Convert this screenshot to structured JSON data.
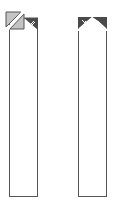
{
  "panels": [
    {
      "id": "left",
      "icon": "fold-split-icon",
      "colors": {
        "light": "#c4c4c4",
        "dark": "#4a4a4a",
        "border": "#555555"
      }
    },
    {
      "id": "right",
      "icon": "notch-peak-icon",
      "colors": {
        "dark": "#4a4a4a",
        "border": "#555555"
      }
    }
  ]
}
